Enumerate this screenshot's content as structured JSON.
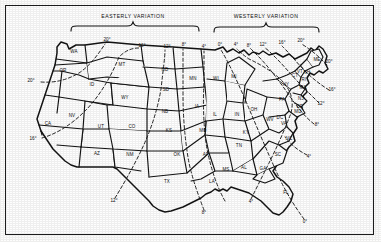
{
  "figure": {
    "type": "map",
    "frame_color": "#1d1d1d",
    "background_color": "#fefefe",
    "line_color": "#141414"
  },
  "headers": [
    {
      "id": "easterly",
      "label": "EASTERLY VARIATION",
      "x": 132,
      "y": 17
    },
    {
      "id": "westerly",
      "label": "WESTERLY VARIATION",
      "x": 265,
      "y": 17
    }
  ],
  "braces": [
    {
      "id": "easterly-brace",
      "x_start": 70,
      "x_end": 198,
      "y": 24,
      "tip_x": 132
    },
    {
      "id": "westerly-brace",
      "x_start": 213,
      "x_end": 318,
      "y": 24,
      "tip_x": 265
    }
  ],
  "states": [
    {
      "abbr": "WA",
      "x": 73,
      "y": 52
    },
    {
      "abbr": "OR",
      "x": 62,
      "y": 71
    },
    {
      "abbr": "CA",
      "x": 47,
      "y": 124
    },
    {
      "abbr": "NV",
      "x": 71,
      "y": 116
    },
    {
      "abbr": "ID",
      "x": 91,
      "y": 85
    },
    {
      "abbr": "MT",
      "x": 121,
      "y": 65
    },
    {
      "abbr": "WY",
      "x": 124,
      "y": 98
    },
    {
      "abbr": "UT",
      "x": 100,
      "y": 127
    },
    {
      "abbr": "AZ",
      "x": 96,
      "y": 154
    },
    {
      "abbr": "CO",
      "x": 131,
      "y": 127
    },
    {
      "abbr": "NM",
      "x": 129,
      "y": 155
    },
    {
      "abbr": "ND",
      "x": 164,
      "y": 70
    },
    {
      "abbr": "SD",
      "x": 165,
      "y": 90
    },
    {
      "abbr": "NB",
      "x": 164,
      "y": 112
    },
    {
      "abbr": "KS",
      "x": 168,
      "y": 131
    },
    {
      "abbr": "OK",
      "x": 176,
      "y": 155
    },
    {
      "abbr": "TX",
      "x": 166,
      "y": 182
    },
    {
      "abbr": "MN",
      "x": 192,
      "y": 79
    },
    {
      "abbr": "IA",
      "x": 196,
      "y": 107
    },
    {
      "abbr": "MO",
      "x": 202,
      "y": 131
    },
    {
      "abbr": "AR",
      "x": 205,
      "y": 155
    },
    {
      "abbr": "LA",
      "x": 211,
      "y": 182
    },
    {
      "abbr": "WI",
      "x": 215,
      "y": 79
    },
    {
      "abbr": "IL",
      "x": 214,
      "y": 115
    },
    {
      "abbr": "MS",
      "x": 225,
      "y": 170
    },
    {
      "abbr": "MI",
      "x": 233,
      "y": 77
    },
    {
      "abbr": "IN",
      "x": 236,
      "y": 115
    },
    {
      "abbr": "KY",
      "x": 245,
      "y": 133
    },
    {
      "abbr": "TN",
      "x": 238,
      "y": 146
    },
    {
      "abbr": "AL",
      "x": 243,
      "y": 168
    },
    {
      "abbr": "OH",
      "x": 253,
      "y": 110
    },
    {
      "abbr": "GA",
      "x": 262,
      "y": 169
    },
    {
      "abbr": "WV",
      "x": 269,
      "y": 120
    },
    {
      "abbr": "SC",
      "x": 277,
      "y": 155
    },
    {
      "abbr": "VA",
      "x": 283,
      "y": 124
    },
    {
      "abbr": "NC",
      "x": 288,
      "y": 139
    },
    {
      "abbr": "PA",
      "x": 281,
      "y": 100
    },
    {
      "abbr": "NY",
      "x": 285,
      "y": 85
    },
    {
      "abbr": "MD",
      "x": 297,
      "y": 112
    },
    {
      "abbr": "DC",
      "x": 279,
      "y": 118
    },
    {
      "abbr": "DE",
      "x": 299,
      "y": 107
    },
    {
      "abbr": "NJ",
      "x": 300,
      "y": 99
    },
    {
      "abbr": "CT",
      "x": 294,
      "y": 76
    },
    {
      "abbr": "RI",
      "x": 303,
      "y": 80
    },
    {
      "abbr": "MA",
      "x": 302,
      "y": 88
    },
    {
      "abbr": "VT",
      "x": 299,
      "y": 72
    },
    {
      "abbr": "NH",
      "x": 306,
      "y": 73
    },
    {
      "abbr": "ME",
      "x": 316,
      "y": 60
    },
    {
      "abbr": "FL",
      "x": 285,
      "y": 193
    }
  ],
  "degree_labels": [
    {
      "value": "20°",
      "x": 106,
      "y": 40,
      "edge": "top"
    },
    {
      "value": "16°",
      "x": 141,
      "y": 46,
      "edge": "top"
    },
    {
      "value": "12°",
      "x": 166,
      "y": 47,
      "edge": "top"
    },
    {
      "value": "8°",
      "x": 183,
      "y": 45,
      "edge": "top"
    },
    {
      "value": "4°",
      "x": 203,
      "y": 47,
      "edge": "top"
    },
    {
      "value": "0°",
      "x": 219,
      "y": 45,
      "edge": "top"
    },
    {
      "value": "4°",
      "x": 235,
      "y": 45,
      "edge": "top"
    },
    {
      "value": "8°",
      "x": 248,
      "y": 46,
      "edge": "top"
    },
    {
      "value": "12°",
      "x": 262,
      "y": 45,
      "edge": "top"
    },
    {
      "value": "16°",
      "x": 281,
      "y": 43,
      "edge": "top"
    },
    {
      "value": "20°",
      "x": 300,
      "y": 41,
      "edge": "top"
    },
    {
      "value": "20°",
      "x": 30,
      "y": 81,
      "edge": "left"
    },
    {
      "value": "16°",
      "x": 32,
      "y": 139,
      "edge": "left"
    },
    {
      "value": "20°",
      "x": 328,
      "y": 62,
      "edge": "right"
    },
    {
      "value": "16°",
      "x": 331,
      "y": 90,
      "edge": "right"
    },
    {
      "value": "12°",
      "x": 320,
      "y": 104,
      "edge": "right"
    },
    {
      "value": "8°",
      "x": 316,
      "y": 125,
      "edge": "right"
    },
    {
      "value": "4°",
      "x": 308,
      "y": 157,
      "edge": "right"
    },
    {
      "value": "12°",
      "x": 113,
      "y": 201,
      "edge": "bottom"
    },
    {
      "value": "8°",
      "x": 203,
      "y": 213,
      "edge": "bottom"
    },
    {
      "value": "4°",
      "x": 250,
      "y": 202,
      "edge": "bottom"
    },
    {
      "value": "0°",
      "x": 304,
      "y": 222,
      "edge": "bottom"
    }
  ],
  "isogonic_lines": [
    {
      "id": "20E-west",
      "label": "20°",
      "variation": "easterly"
    },
    {
      "id": "16E",
      "label": "16°",
      "variation": "easterly"
    },
    {
      "id": "12E",
      "label": "12°",
      "variation": "easterly"
    },
    {
      "id": "8E",
      "label": "8°",
      "variation": "easterly"
    },
    {
      "id": "4E",
      "label": "4°",
      "variation": "easterly"
    },
    {
      "id": "0-agonic",
      "label": "0°",
      "variation": "agonic"
    },
    {
      "id": "4W",
      "label": "4°",
      "variation": "westerly"
    },
    {
      "id": "8W",
      "label": "8°",
      "variation": "westerly"
    },
    {
      "id": "12W",
      "label": "12°",
      "variation": "westerly"
    },
    {
      "id": "16W",
      "label": "16°",
      "variation": "westerly"
    },
    {
      "id": "20W",
      "label": "20°",
      "variation": "westerly"
    }
  ]
}
